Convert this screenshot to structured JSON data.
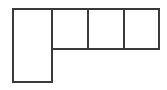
{
  "figure": {
    "shape_name": "l-shaped-grid",
    "background_color": "#ffffff",
    "stroke_color": "#3a3a3a",
    "stroke_width": 2,
    "canvas": {
      "width": 167,
      "height": 90
    },
    "geometry": {
      "left": 13,
      "top": 9,
      "right": 159,
      "arm_bottom": 49,
      "leg_bottom": 82,
      "leg_right": 52,
      "cell_width": 36,
      "cell_height": 40
    },
    "outline_path": "M 13 9 L 159 9 L 159 49 L 52 49 L 52 82 L 13 82 Z",
    "divider_lines": [
      {
        "name": "divider-1",
        "x1": 52,
        "y1": 9,
        "x2": 52,
        "y2": 49
      },
      {
        "name": "divider-2",
        "x1": 88,
        "y1": 9,
        "x2": 88,
        "y2": 49
      },
      {
        "name": "divider-3",
        "x1": 124,
        "y1": 9,
        "x2": 124,
        "y2": 49
      }
    ],
    "cells": [
      {
        "name": "cell-top-left",
        "x": 13,
        "y": 9,
        "width": 39,
        "height": 40
      },
      {
        "name": "cell-top-middle",
        "x": 52,
        "y": 9,
        "width": 36,
        "height": 40
      },
      {
        "name": "cell-top-right-inner",
        "x": 88,
        "y": 9,
        "width": 36,
        "height": 40
      },
      {
        "name": "cell-top-right-outer",
        "x": 124,
        "y": 9,
        "width": 35,
        "height": 40
      },
      {
        "name": "cell-bottom-left",
        "x": 13,
        "y": 49,
        "width": 39,
        "height": 33
      }
    ],
    "cell_count": 4,
    "labels": []
  }
}
